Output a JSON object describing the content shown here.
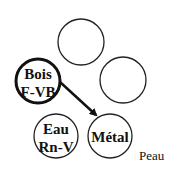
{
  "diagram": {
    "nodes": [
      {
        "id": "top",
        "lines": []
      },
      {
        "id": "right",
        "lines": []
      },
      {
        "id": "bois",
        "lines": [
          "Bois",
          "F-VB"
        ],
        "emphasized": true
      },
      {
        "id": "eau",
        "lines": [
          "Eau",
          "Rn-V"
        ]
      },
      {
        "id": "metal",
        "lines": [
          "Métal"
        ]
      }
    ],
    "edges": [
      {
        "from": "bois",
        "to": "metal",
        "type": "arrow"
      }
    ],
    "caption": "Peau"
  }
}
